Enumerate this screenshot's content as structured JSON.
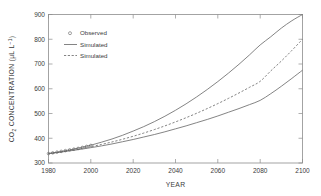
{
  "chart_data": {
    "type": "line",
    "title": "",
    "xlabel": "YEAR",
    "ylabel": "CO2 CONCENTRATION (µL L⁻¹)",
    "ylabel_parts": {
      "prefix": "CO",
      "subscript": "2",
      "middle": " CONCENTRATION (",
      "unit_mu": "µL L",
      "superscript": "−1",
      "suffix": ")"
    },
    "xlim": [
      1980,
      2100
    ],
    "ylim": [
      300,
      900
    ],
    "xticks": [
      1980,
      2000,
      2020,
      2040,
      2060,
      2080,
      2100
    ],
    "yticks": [
      300,
      400,
      500,
      600,
      700,
      800,
      900
    ],
    "xtick_labels": [
      "1980",
      "2000",
      "2020",
      "2040",
      "2060",
      "2080",
      "2100"
    ],
    "ytick_labels": [
      "300",
      "400",
      "500",
      "600",
      "700",
      "800",
      "900"
    ],
    "grid": false,
    "legend_position": "upper left",
    "legend": [
      {
        "label": "Observed",
        "style": "marker",
        "marker": "circle"
      },
      {
        "label": "Simulated",
        "style": "solid"
      },
      {
        "label": "Simulated",
        "style": "dashed"
      }
    ],
    "x": [
      1980,
      1985,
      1990,
      1995,
      2000,
      2005,
      2010,
      2015,
      2020,
      2025,
      2030,
      2035,
      2040,
      2045,
      2050,
      2055,
      2060,
      2065,
      2070,
      2075,
      2080,
      2085,
      2090,
      2095,
      2100
    ],
    "series": [
      {
        "name": "Simulated high",
        "style": "solid",
        "values": [
          338,
          345,
          353,
          362,
          372,
          384,
          397,
          412,
          429,
          447,
          467,
          489,
          513,
          539,
          567,
          597,
          629,
          663,
          699,
          737,
          777,
          810,
          845,
          875,
          900
        ]
      },
      {
        "name": "Simulated mid",
        "style": "dashed",
        "values": [
          338,
          344,
          351,
          358,
          366,
          375,
          385,
          396,
          408,
          421,
          435,
          450,
          466,
          483,
          501,
          520,
          540,
          561,
          583,
          606,
          630,
          672,
          712,
          755,
          800
        ]
      },
      {
        "name": "Simulated low",
        "style": "solid",
        "values": [
          338,
          343,
          349,
          355,
          362,
          369,
          377,
          386,
          395,
          405,
          415,
          426,
          438,
          450,
          463,
          476,
          490,
          505,
          520,
          536,
          553,
          580,
          610,
          642,
          675
        ]
      },
      {
        "name": "Observed",
        "style": "marker",
        "x": [
          1980,
          1982,
          1984,
          1986,
          1988,
          1990,
          1992,
          1994,
          1996,
          1998,
          2000
        ],
        "values": [
          338,
          341,
          344,
          347,
          350,
          353,
          356,
          359,
          363,
          367,
          371
        ]
      }
    ]
  },
  "axis": {
    "xlabel": "YEAR"
  }
}
